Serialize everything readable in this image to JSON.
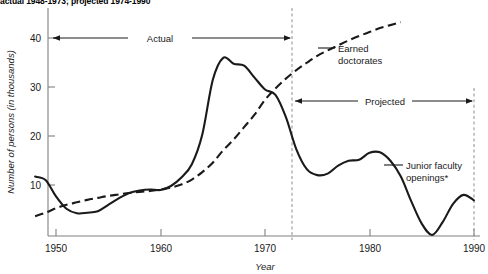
{
  "title": "actual 1948-1973; projected 1974-1990",
  "axes": {
    "ylabel": "Number of persons (in thousands)",
    "xlabel": "Year",
    "yticks": [
      "10",
      "20",
      "30",
      "40"
    ],
    "xticks": [
      "1950",
      "1960",
      "1970",
      "1980",
      "1990"
    ]
  },
  "annotations": {
    "actual_span": "Actual",
    "projected_span": "Projected",
    "earned_line1": "Earned",
    "earned_line2": "doctorates",
    "junior_line1": "Junior faculty",
    "junior_line2": "openings*"
  },
  "colors": {
    "ink": "#1a1a1a",
    "axis": "#808080",
    "divider": "#999999"
  },
  "chart_data": {
    "type": "line",
    "title": "actual 1948-1973; projected 1974-1990",
    "xlabel": "Year",
    "ylabel": "Number of persons (in thousands)",
    "xlim": [
      1948,
      1990
    ],
    "ylim": [
      0,
      45
    ],
    "xticks": [
      1950,
      1960,
      1970,
      1980,
      1990
    ],
    "yticks": [
      10,
      20,
      30,
      40
    ],
    "grid": false,
    "legend": "annotations-on-plot",
    "divider_year": 1973.5,
    "spans": [
      {
        "label": "Actual",
        "from": 1948,
        "to": 1973.5,
        "y": 40
      },
      {
        "label": "Projected",
        "from": 1973.5,
        "to": 1990,
        "y": 23.5
      }
    ],
    "series": [
      {
        "name": "Junior faculty openings*",
        "style": "solid",
        "x": [
          1948,
          1949,
          1950,
          1951,
          1952,
          1953,
          1954,
          1955,
          1956,
          1957,
          1958,
          1959,
          1960,
          1961,
          1962,
          1963,
          1964,
          1965,
          1966,
          1967,
          1968,
          1969,
          1970,
          1971,
          1972,
          1973,
          1974,
          1975,
          1976,
          1977,
          1978,
          1979,
          1980,
          1981,
          1982,
          1983,
          1984,
          1985,
          1986,
          1987,
          1988,
          1989,
          1990
        ],
        "values": [
          12.0,
          11.3,
          8.0,
          5.5,
          4.6,
          4.7,
          5.0,
          6.3,
          7.6,
          8.7,
          9.2,
          9.4,
          9.3,
          10.1,
          11.8,
          14.5,
          20.5,
          31.5,
          36.0,
          34.8,
          34.4,
          32.0,
          29.6,
          28.5,
          24.0,
          17.5,
          13.5,
          12.3,
          12.6,
          14.2,
          15.2,
          15.4,
          16.8,
          16.9,
          15.2,
          12.0,
          7.0,
          2.5,
          0.2,
          2.8,
          6.5,
          8.3,
          7.2
        ]
      },
      {
        "name": "Earned doctorates",
        "style": "dashed",
        "x": [
          1948,
          1949,
          1950,
          1951,
          1952,
          1953,
          1954,
          1955,
          1956,
          1957,
          1958,
          1959,
          1960,
          1961,
          1962,
          1963,
          1964,
          1965,
          1966,
          1967,
          1968,
          1969,
          1970,
          1971,
          1972,
          1973,
          1974,
          1975,
          1976,
          1977,
          1978,
          1979,
          1980,
          1981,
          1982,
          1983
        ],
        "values": [
          4.0,
          4.7,
          5.6,
          6.3,
          6.8,
          7.3,
          7.7,
          8.1,
          8.4,
          8.7,
          8.9,
          9.1,
          9.4,
          9.8,
          10.4,
          11.4,
          12.9,
          14.8,
          17.3,
          19.5,
          22.0,
          24.5,
          27.5,
          29.8,
          31.8,
          33.5,
          35.0,
          36.4,
          37.5,
          38.5,
          39.5,
          40.4,
          41.2,
          42.0,
          42.6,
          43.2
        ]
      }
    ]
  }
}
